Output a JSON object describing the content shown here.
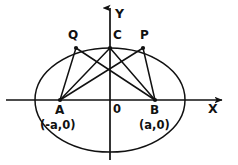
{
  "figure": {
    "kind": "geometry-diagram",
    "background_color": "#ffffff",
    "stroke_color": "#111111"
  },
  "axes": {
    "x_label": "X",
    "y_label": "Y",
    "origin_label": "0",
    "x_axis": {
      "y": 100,
      "x_start": 6,
      "x_end": 222,
      "arrow": "right"
    },
    "y_axis": {
      "x": 110,
      "y_start": 160,
      "y_end": 8,
      "arrow": "up"
    }
  },
  "ellipse": {
    "center_x": 110,
    "center_y": 100,
    "radius_x": 75,
    "radius_y": 52
  },
  "points": [
    {
      "id": "A",
      "label": "A",
      "coord_label": "(-a,0)",
      "x": 60,
      "y": 100,
      "marker": true
    },
    {
      "id": "B",
      "label": "B",
      "coord_label": "(a,0)",
      "x": 155,
      "y": 100,
      "marker": true
    },
    {
      "id": "C",
      "label": "C",
      "coord_label": "",
      "x": 110,
      "y": 48,
      "marker": true
    },
    {
      "id": "Q",
      "label": "Q",
      "coord_label": "",
      "x": 76,
      "y": 48,
      "marker": true
    },
    {
      "id": "P",
      "label": "P",
      "coord_label": "",
      "x": 143,
      "y": 48,
      "marker": true
    }
  ],
  "chords": [
    {
      "id": "AQ",
      "from": "A",
      "to": "Q",
      "x1": 60,
      "y1": 100,
      "x2": 76,
      "y2": 48
    },
    {
      "id": "AC",
      "from": "A",
      "to": "C",
      "x1": 60,
      "y1": 100,
      "x2": 110,
      "y2": 48
    },
    {
      "id": "AP",
      "from": "A",
      "to": "P",
      "x1": 60,
      "y1": 100,
      "x2": 143,
      "y2": 48
    },
    {
      "id": "BQ",
      "from": "B",
      "to": "Q",
      "x1": 155,
      "y1": 100,
      "x2": 76,
      "y2": 48
    },
    {
      "id": "BC",
      "from": "B",
      "to": "C",
      "x1": 155,
      "y1": 100,
      "x2": 110,
      "y2": 48
    },
    {
      "id": "BP",
      "from": "B",
      "to": "P",
      "x1": 155,
      "y1": 100,
      "x2": 143,
      "y2": 48
    }
  ],
  "labels": {
    "Q": "Q",
    "C": "C",
    "P": "P",
    "A": "A",
    "B": "B",
    "A_coord": "(-a,0)",
    "B_coord": "(a,0)",
    "origin": "0",
    "x_axis": "X",
    "y_axis": "Y"
  }
}
